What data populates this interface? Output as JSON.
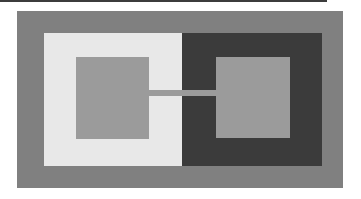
{
  "artwork": {
    "title": "Nested Squares Geometric Composition",
    "canvas": {
      "width": 361,
      "height": 199,
      "background_color": "#ffffff"
    },
    "palette": {
      "background": "#ffffff",
      "rule": "#2b2b2b",
      "frame_gray": "#808080",
      "panel_light": "#e8e8e8",
      "panel_dark": "#3b3b3b",
      "inner_square_gray": "#9b9b9b"
    },
    "shapes": [
      {
        "name": "top-rule",
        "role": "thin dark horizontal rule along top edge",
        "color": "#2b2b2b",
        "x": 0,
        "y": 0,
        "width": 327,
        "height": 2
      },
      {
        "name": "outer-frame",
        "role": "outer medium gray rectangle frame",
        "color": "#808080",
        "x": 17,
        "y": 11,
        "width": 326,
        "height": 177
      },
      {
        "name": "light-panel",
        "role": "left light gray panel",
        "color": "#e8e8e8",
        "x": 44,
        "y": 33,
        "width": 138,
        "height": 133
      },
      {
        "name": "dark-panel",
        "role": "right dark charcoal panel",
        "color": "#3b3b3b",
        "x": 182,
        "y": 33,
        "width": 140,
        "height": 133
      },
      {
        "name": "left-inner-square",
        "role": "medium gray square inside light panel",
        "color": "#9b9b9b",
        "x": 76,
        "y": 57,
        "width": 73,
        "height": 82
      },
      {
        "name": "right-inner-square",
        "role": "medium gray square inside dark panel",
        "color": "#9b9b9b",
        "x": 216,
        "y": 57,
        "width": 74,
        "height": 81
      },
      {
        "name": "connector-bar",
        "role": "horizontal gray bar linking the two inner squares",
        "color": "#9b9b9b",
        "x": 147,
        "y": 90,
        "width": 71,
        "height": 6
      }
    ]
  }
}
